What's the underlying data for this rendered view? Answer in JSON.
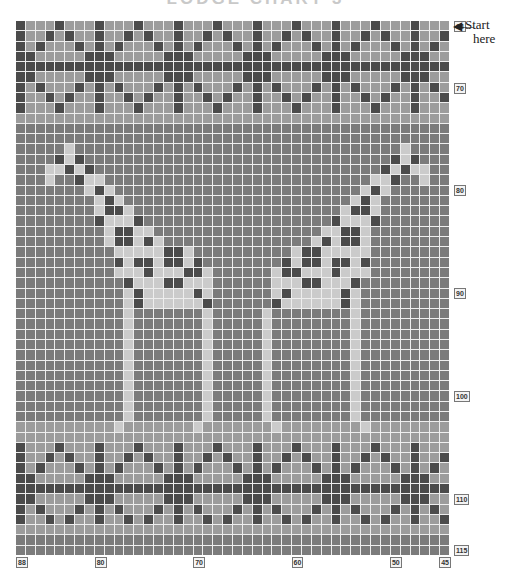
{
  "title": "LODGE CHART 3",
  "start_label": {
    "line1": "Start",
    "line2": "here"
  },
  "arrow_glyph": "◀—",
  "colors": {
    "D": "#4b4b4b",
    "M": "#7b7b7b",
    "B": "#9c9c9c",
    "L": "#cbcbcb",
    "grid_line": "#eeeeee"
  },
  "chart_data": {
    "type": "heatmap",
    "title": "LODGE CHART 3",
    "columns": 44,
    "rows": 52,
    "col_range": [
      88,
      45
    ],
    "row_range": [
      64,
      115
    ],
    "legend": {
      "D": "dark",
      "M": "medium",
      "B": "light grey",
      "L": "pale (giraffe)"
    },
    "col_labels": [
      {
        "text": "88",
        "col": 0
      },
      {
        "text": "80",
        "col": 8
      },
      {
        "text": "70",
        "col": 18
      },
      {
        "text": "60",
        "col": 28
      },
      {
        "text": "50",
        "col": 38
      },
      {
        "text": "45",
        "col": 43
      }
    ],
    "row_labels": [
      {
        "text": "64",
        "row": 0
      },
      {
        "text": "70",
        "row": 6
      },
      {
        "text": "80",
        "row": 16
      },
      {
        "text": "90",
        "row": 26
      },
      {
        "text": "100",
        "row": 36
      },
      {
        "text": "110",
        "row": 46
      },
      {
        "text": "115",
        "row": 51
      }
    ],
    "grid": [
      "DBBBDBBBDBBBDBBBDBBBDBBBDBBBDBBBDBBBDBBBDBBB",
      "DBBDBDBBDBBDBDBBDBBDBDBBDBBDBDBBDBBDBDBBDBBD",
      "DBDBBBDBDBDBBBDBDBDBBBDBDBDBBBDBDBDBBBDBDBDB",
      "DDBBBBBDDDBBBBBDDDBBBBBDDDBBBBBDDDBBBBBDDDBB",
      "DDDDDDDDDDDDDDDDDDDDDDDDDDDDDDDDDDDDDDDDDDDD",
      "DDBBBBBDDDBBBBBDDDBBBBBDDDBBBBBDDDBBBBBDDDBB",
      "DBDBBBDBDBDBBBDBDBDBBBDBDBDBBBDBDBDBBBDBDBDB",
      "DBBDBDBBDBBDBDBBDBBDBDBBDBBDBDBBDBBDBDBBDBBD",
      "DBBBDBBBDBBBDBBBDBBBDBBBDBBBDBBBDBBBDBBBDBBB",
      "BBBBBBBBBBBBBBBBBBBBBBBBBBBBBBBBBBBBBBBBBBBB",
      "MMMMMMMMMMMMMMMMMMMMMMMMMMMMMMMMMMMMMMMMMMMM",
      "MMMMMMMMMMMMMMMMMMMMMMMMMMMMMMMMMMMMMMMMMMMM",
      "MMMMMLMMMMMMMMMMMMMMMMMMMMMMMMMMMMMMMMMLMMMM",
      "MMMMDLDMMMMMMMMMMMMMMMMMMMMMMMMMMMMMMMDLDMMM",
      "MMMLLDLDMMMMMMMMMMMMMMMMMMMMMMMMMMMMMDLDLLMM",
      "MMMLMMDLLMMMMMMMMMMMMMMMMMMMMMMMMMMMLLDMMLMM",
      "MMMMMMMLDLMMMMMMMMMMMMMMMMMMMMMMMMMLDLMMMMMM",
      "MMMMMMMMLDLMMMMMMMMMMMMMMMMMMMMMMMLDLMMMMMMM",
      "MMMMMMMMLDDLMMMMMMMMMMMMMMMMMMMMMLDDLMMMMMMM",
      "MMMMMMMMDLLLDMMMMMMMMMMMMMMMMMMMDLLLDMMMMMMM",
      "MMMMMMMMMLDDLLMMMMMMMMMMMMMMMMMLLDDLMMMMMMMM",
      "MMMMMMMMMLDDLDLMMMMMMMMMMMMMMMLDLDDLMMMMMMMM",
      "MMMMMMMMMMLLLLLDDLMMMMMMMMMMLDDLLLLLMMMMMMMM",
      "MMMMMMMMMMDLDDLDDLDMMMMMMMMDLDDLDDLDMMMMMMMM",
      "MMMMMMMMMMLLLDLLLDDLMMMMMMLDDLLLDLLLMMMMMMMM",
      "MMMMMMMMMMMDLLLDDLLLMMMMMMLLLDDLLLDMMMMMMMMM",
      "MMMMMMMMMMMLDLLLLLDLMMMMMMLDLLLLLDLMMMMMMMMM",
      "MMMMMMMMMMMLDLLLLLLDMMMMMMDLLLLLLDLMMMMMMMMM",
      "MMMMMMMMMMMLMMMMMMMLMMMMMLMMMMMMMMLMMMMMMMMM",
      "MMMMMMMMMMMLMMMMMMMLMMMMMLMMMMMMMMLMMMMMMMMM",
      "MMMMMMMMMMMLMMMMMMMLMMMMMLMMMMMMMMLMMMMMMMMM",
      "MMMMMMMMMMMLMMMMMMMLMMMMMLMMMMMMMMLMMMMMMMMM",
      "MMMMMMMMMMMLMMMMMMMLMMMMMLMMMMMMMMLMMMMMMMMM",
      "MMMMMMMMMMMLMMMMMMMLMMMMMLMMMMMMMMLMMMMMMMMM",
      "MMMMMMMMMMMLMMMMMMMLMMMMMLMMMMMMMMLMMMMMMMMM",
      "MMMMMMMMMMMLMMMMMMMLMMMMMLMMMMMMMMLMMMMMMMMM",
      "MMMMMMMMMMMLMMMMMMMLMMMMMLMMMMMMMMLMMMMMMMMM",
      "MMMMMMMMMMMLMMMMMMMLMMMMMLMMMMMMMMLMMMMMMMMM",
      "MMMMMMMMMMMLMMMMMMMLMMMMMLMMMMMMMMLMMMMMMMMM",
      "BBBBBBBBBBLBBBBBBBLBBBBBBBLBBBBBBBBLBBBBBBBB",
      "BBBBBBBBBBBBBBBBBBBBBBBBBBBBBBBBBBBBBBBBBBBB",
      "DBBBDBBBDBBBDBBBDBBBDBBBDBBBDBBBDBBBDBBBDBBB",
      "DBBDBDBBDBBDBDBBDBBDBDBBDBBDBDBBDBBDBDBBDBBD",
      "DBDBBBDBDBDBBBDBDBDBBBDBDBDBBBDBDBDBBBDBDBDB",
      "DDBBBBBDDDBBBBBDDDBBBBBDDDBBBBBDDDBBBBBDDDBB",
      "DDDDDDDDDDDDDDDDDDDDDDDDDDDDDDDDDDDDDDDDDDDD",
      "DDBBBBBDDDBBBBBDDDBBBBBDDDBBBBBDDDBBBBBDDDBB",
      "DBDBBBDBDBDBBBDBDBDBBBDBDBDBBBDBDBDBBBDBDBDB",
      "DBBDBDBBDBBDBDBBDBBDBDBBDBBDBDBBDBBDBDBBDBBD",
      "BBBBBBBBBBBBBBBBBBBBBBBBBBBBBBBBBBBBBBBBBBBB",
      "MMMMMMMMMMMMMMMMMMMMMMMMMMMMMMMMMMMMMMMMMMMM",
      "MMMMMMMMMMMMMMMMMMMMMMMMMMMMMMMMMMMMMMMMMMMM"
    ]
  }
}
